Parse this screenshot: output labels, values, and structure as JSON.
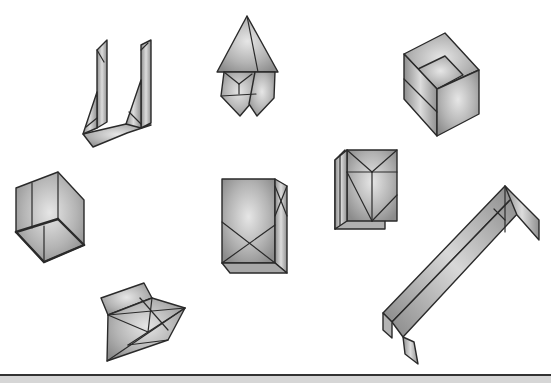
{
  "figure": {
    "background": "#ffffff",
    "shape_count": 8,
    "shapes": [
      {
        "id": "u-shaped-fold",
        "label": ""
      },
      {
        "id": "kite-fold",
        "label": ""
      },
      {
        "id": "open-box-top-right",
        "label": ""
      },
      {
        "id": "cube-fold-left",
        "label": ""
      },
      {
        "id": "tall-box-x-fold",
        "label": ""
      },
      {
        "id": "double-panel-fold",
        "label": ""
      },
      {
        "id": "long-channel-fold",
        "label": ""
      },
      {
        "id": "pyramid-crease-fold",
        "label": ""
      }
    ],
    "colors": {
      "fill_light": "#e4e4e4",
      "fill_mid": "#b8b8b8",
      "fill_dark": "#8a8a8a",
      "stroke": "#2a2a2a",
      "bottom_rule": "#333333",
      "bottom_strip": "#d6d6d6"
    }
  }
}
